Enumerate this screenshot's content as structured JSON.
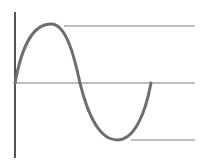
{
  "diagram": {
    "type": "sine-wave",
    "colors": {
      "background": "#ffffff",
      "axis": "#1a1a1a",
      "wave": "#6e6e6e",
      "reference_line": "#7a7a7a"
    },
    "wave": {
      "start": [
        15,
        83
      ],
      "peak": [
        51,
        24
      ],
      "mid_crossing": [
        80,
        83
      ],
      "trough": [
        117,
        140
      ],
      "end": [
        151,
        83
      ],
      "periods": 1
    },
    "reference_lines": [
      {
        "name": "peak-level",
        "x1": 64,
        "x2": 195,
        "y": 26
      },
      {
        "name": "zero-level",
        "x1": 15,
        "x2": 195,
        "y": 83
      },
      {
        "name": "trough-level",
        "x1": 131,
        "x2": 195,
        "y": 140
      }
    ]
  }
}
